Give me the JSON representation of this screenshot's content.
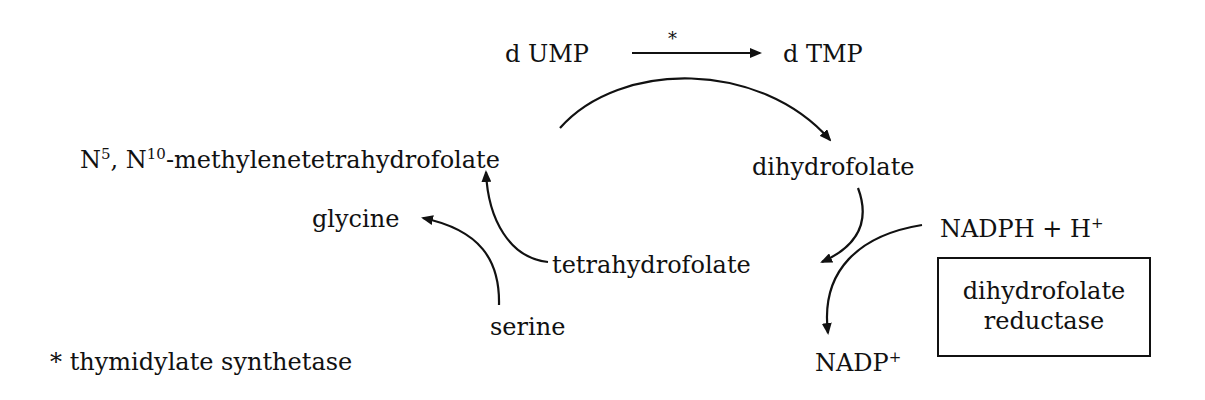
{
  "diagram": {
    "top_reaction": {
      "substrate": "d UMP",
      "product": "d TMP",
      "enzyme_marker": "*"
    },
    "nodes": {
      "methylene_thf": {
        "n5": "N",
        "n5_sup": "5",
        "sep": ", ",
        "n10": "N",
        "n10_sup": "10",
        "rest": "-methylenetetrahydrofolate"
      },
      "dihydrofolate": "dihydrofolate",
      "tetrahydrofolate": "tetrahydrofolate",
      "glycine": "glycine",
      "serine": "serine",
      "nadph": {
        "text": "NADPH + H",
        "sup": "+"
      },
      "nadp": {
        "text": "NADP",
        "sup": "+"
      }
    },
    "enzyme_box": {
      "line1": "dihydrofolate",
      "line2": "reductase"
    },
    "footnote": "* thymidylate synthetase"
  }
}
